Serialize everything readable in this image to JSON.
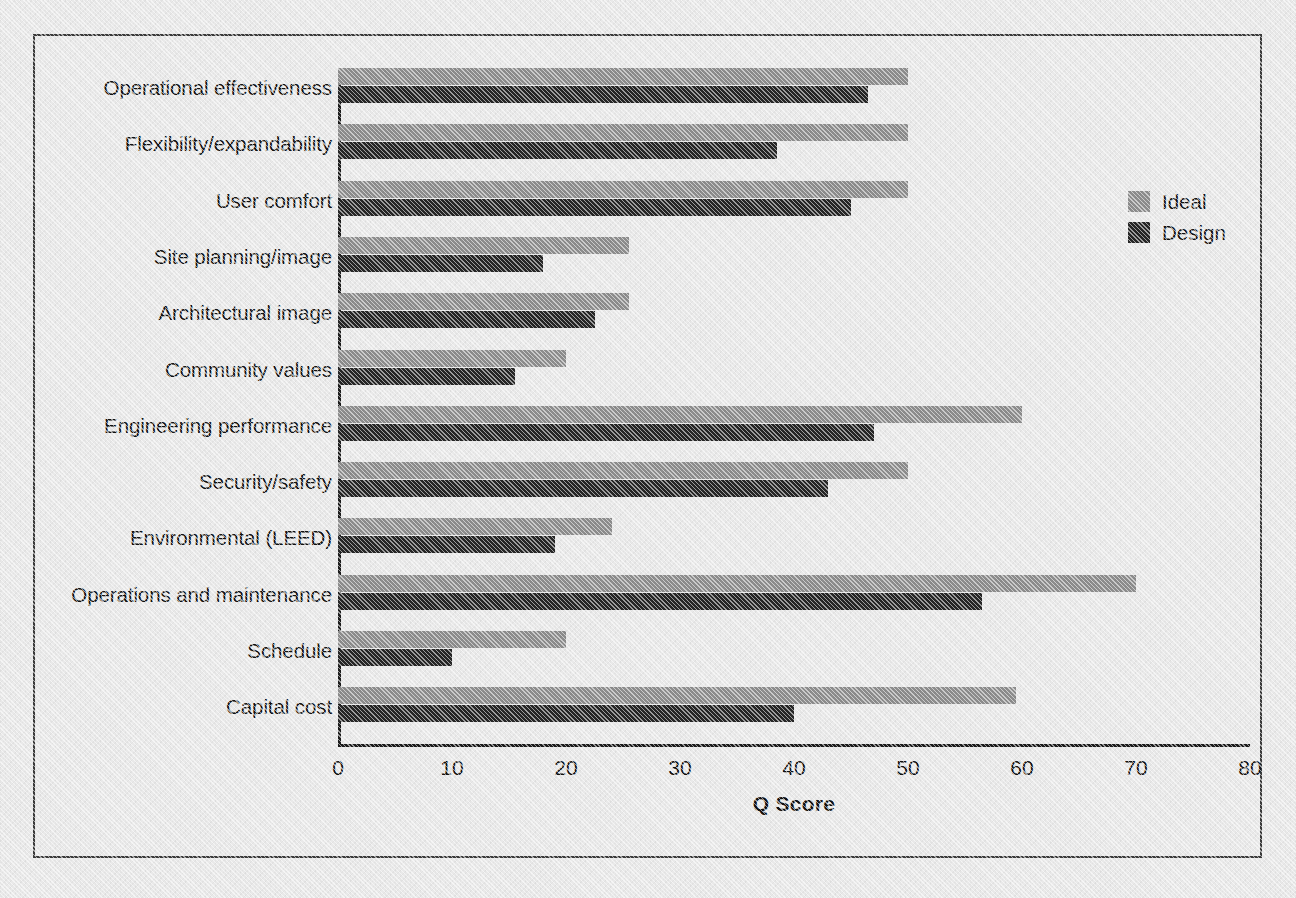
{
  "chart_data": {
    "type": "bar",
    "orientation": "horizontal",
    "title": "",
    "xlabel": "Q Score",
    "ylabel": "",
    "xlim": [
      0,
      80
    ],
    "xticks": [
      0,
      10,
      20,
      30,
      40,
      50,
      60,
      70,
      80
    ],
    "grid": false,
    "legend_position": "right",
    "categories": [
      "Operational effectiveness",
      "Flexibility/expandability",
      "User comfort",
      "Site planning/image",
      "Architectural image",
      "Community values",
      "Engineering performance",
      "Security/safety",
      "Environmental (LEED)",
      "Operations and maintenance",
      "Schedule",
      "Capital cost"
    ],
    "series": [
      {
        "name": "Ideal",
        "color": "#8d8d8d",
        "values": [
          50,
          50,
          50,
          25.5,
          25.5,
          20,
          60,
          50,
          24,
          70,
          20,
          59.5
        ]
      },
      {
        "name": "Design",
        "color": "#262626",
        "values": [
          46.5,
          38.5,
          45,
          18,
          22.5,
          15.5,
          47,
          43,
          19,
          56.5,
          10,
          40
        ]
      }
    ]
  },
  "legend": {
    "items": [
      {
        "label": "Ideal",
        "color": "#8d8d8d"
      },
      {
        "label": "Design",
        "color": "#262626"
      }
    ]
  },
  "axis": {
    "x_title": "Q Score",
    "tick_labels": [
      "0",
      "10",
      "20",
      "30",
      "40",
      "50",
      "60",
      "70",
      "80"
    ]
  }
}
